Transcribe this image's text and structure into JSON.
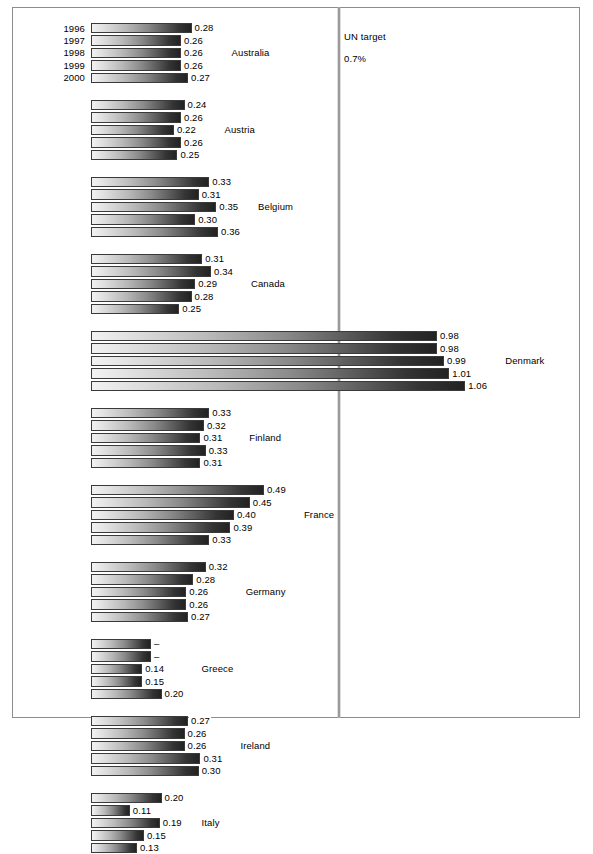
{
  "annotation": {
    "un_target_text": "UN target\n0.7%",
    "un_target_line1": "UN target",
    "un_target_line2": "0.7%",
    "un_target_value": 0.7,
    "line_color": "#9a9a9a"
  },
  "axis": {
    "years": [
      "1996",
      "1997",
      "1998",
      "1999",
      "2000"
    ],
    "value_min": 0,
    "value_max": 1.06
  },
  "chart_data": {
    "type": "bar",
    "orientation": "horizontal",
    "title": "",
    "subtitle": "",
    "xlabel": "",
    "ylabel": "",
    "grid": false,
    "legend": "none",
    "categories": [
      "1996",
      "1997",
      "1998",
      "1999",
      "2000"
    ],
    "xlim": [
      0,
      1.12
    ],
    "annotations": [
      {
        "label": "UN target",
        "label2": "0.7%",
        "value": 0.7,
        "type": "vertical-reference-line"
      }
    ],
    "series": [
      {
        "name": "Australia",
        "values": [
          0.28,
          0.26,
          0.26,
          0.26,
          0.27
        ],
        "labels": [
          "0.28",
          "0.26",
          "0.26",
          "0.26",
          "0.27"
        ],
        "bar_lengths": [
          0.285,
          0.255,
          0.255,
          0.255,
          0.275
        ]
      },
      {
        "name": "Austria",
        "values": [
          0.24,
          0.26,
          0.22,
          0.26,
          0.25
        ],
        "labels": [
          "0.24",
          "0.26",
          "0.22",
          "0.26",
          "0.25"
        ],
        "bar_lengths": [
          0.265,
          0.255,
          0.235,
          0.255,
          0.245
        ]
      },
      {
        "name": "Belgium",
        "values": [
          0.33,
          0.31,
          0.35,
          0.3,
          0.36
        ],
        "labels": [
          "0.33",
          "0.31",
          "0.35",
          "0.30",
          "0.36"
        ],
        "bar_lengths": [
          0.335,
          0.305,
          0.355,
          0.295,
          0.36
        ]
      },
      {
        "name": "Canada",
        "values": [
          0.31,
          0.34,
          0.29,
          0.28,
          0.25
        ],
        "labels": [
          "0.31",
          "0.34",
          "0.29",
          "0.28",
          "0.25"
        ],
        "bar_lengths": [
          0.315,
          0.34,
          0.295,
          0.285,
          0.25
        ]
      },
      {
        "name": "Denmark",
        "values": [
          0.98,
          0.98,
          0.99,
          1.01,
          1.06
        ],
        "labels": [
          "0.98",
          "0.98",
          "0.99",
          "1.01",
          "1.06"
        ],
        "bar_lengths": [
          0.98,
          0.98,
          1.0,
          1.015,
          1.06
        ]
      },
      {
        "name": "Finland",
        "values": [
          0.33,
          0.32,
          0.31,
          0.33,
          0.31
        ],
        "labels": [
          "0.33",
          "0.32",
          "0.31",
          "0.33",
          "0.31"
        ],
        "bar_lengths": [
          0.335,
          0.32,
          0.31,
          0.325,
          0.31
        ]
      },
      {
        "name": "France",
        "values": [
          0.49,
          0.45,
          0.4,
          0.39,
          0.33
        ],
        "labels": [
          "0.49",
          "0.45",
          "0.40",
          "0.39",
          "0.33"
        ],
        "bar_lengths": [
          0.49,
          0.45,
          0.405,
          0.395,
          0.335
        ]
      },
      {
        "name": "Germany",
        "values": [
          0.32,
          0.28,
          0.26,
          0.26,
          0.27
        ],
        "labels": [
          "0.32",
          "0.28",
          "0.26",
          "0.26",
          "0.27"
        ],
        "bar_lengths": [
          0.325,
          0.29,
          0.27,
          0.27,
          0.275
        ]
      },
      {
        "name": "Greece",
        "values": [
          null,
          null,
          0.14,
          0.15,
          0.2
        ],
        "labels": [
          "–",
          "–",
          "0.14",
          "0.15",
          "0.20"
        ],
        "bar_lengths": [
          0.17,
          0.17,
          0.145,
          0.145,
          0.2
        ]
      },
      {
        "name": "Ireland",
        "values": [
          0.27,
          0.26,
          0.26,
          0.31,
          0.3
        ],
        "labels": [
          "0.27",
          "0.26",
          "0.26",
          "0.31",
          "0.30"
        ],
        "bar_lengths": [
          0.275,
          0.265,
          0.265,
          0.31,
          0.305
        ]
      },
      {
        "name": "Italy",
        "values": [
          0.2,
          0.11,
          0.19,
          0.15,
          0.13
        ],
        "labels": [
          "0.20",
          "0.11",
          "0.19",
          "0.15",
          "0.13"
        ],
        "bar_lengths": [
          0.2,
          0.11,
          0.195,
          0.15,
          0.13
        ]
      }
    ]
  },
  "layout": {
    "bar_origin_px": 78,
    "px_per_unit": 353,
    "group_top_px": 14,
    "row_height_px": 12.4,
    "group_gap_px": 15,
    "country_label_x_offset_px": 14
  }
}
